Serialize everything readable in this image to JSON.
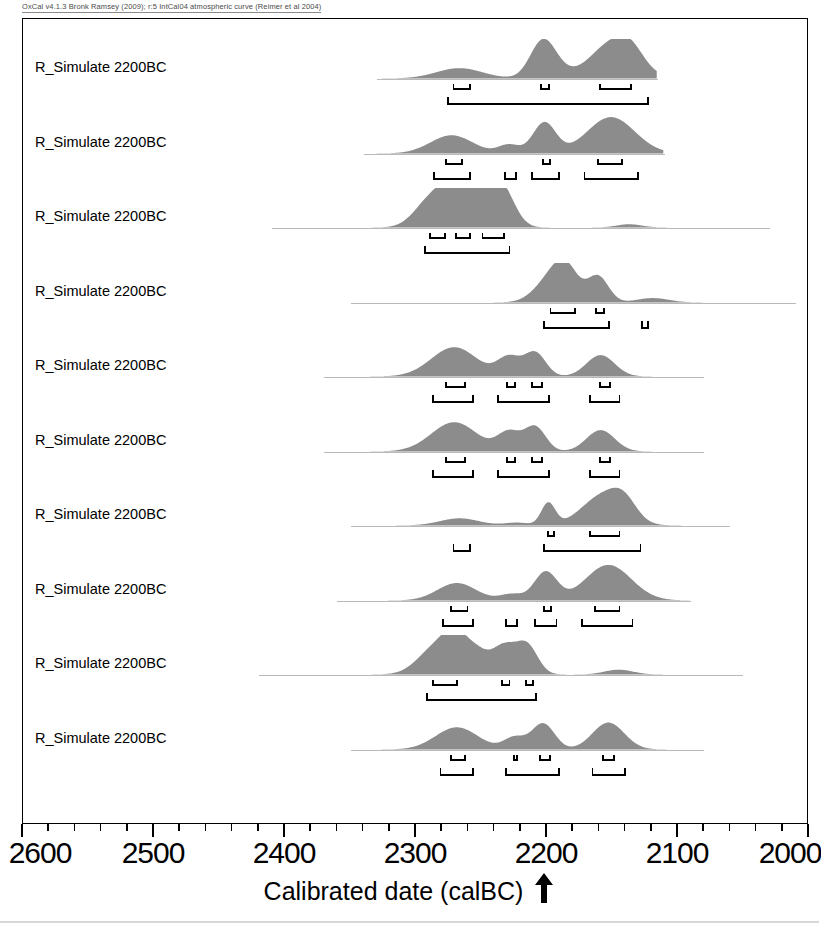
{
  "header": {
    "credit": "OxCal v4.1.3 Bronk Ramsey (2009); r:5 IntCal04 atmospheric curve (Reimer et al 2004)"
  },
  "axis": {
    "title": "Calibrated date (calBC)",
    "arrow_icon": "up-arrow-icon",
    "arrow_points_to": 2200,
    "tick_labels": [
      "2600",
      "2500",
      "2400",
      "2300",
      "2200",
      "2100",
      "2000"
    ],
    "major_ticks": [
      2600,
      2500,
      2400,
      2300,
      2200,
      2100,
      2000
    ],
    "minor_tick_step": 20,
    "min": 2000,
    "max": 2600,
    "direction": "reversed"
  },
  "style": {
    "fill_color": "#8c8c8c",
    "baseline_color": "#b9b9b9",
    "frame_color": "#000000",
    "bracket_color": "#000000"
  },
  "chart_data": {
    "type": "area",
    "xlabel": "Calibrated date (calBC)",
    "ylabel": "",
    "xlim": [
      2600,
      2000
    ],
    "grid": false,
    "legend": "none",
    "sigma_levels": [
      "68.2% (1 sigma)",
      "95.4% (2 sigma)"
    ],
    "rows": [
      {
        "label": "R_Simulate 2200BC",
        "baseline": [
          2330,
          2115
        ],
        "peaks": [
          {
            "center": 2266,
            "height": 0.26,
            "width": 26
          },
          {
            "center": 2203,
            "height": 0.74,
            "width": 14
          },
          {
            "center": 2196,
            "height": 0.3,
            "width": 16
          },
          {
            "center": 2148,
            "height": 0.92,
            "width": 26
          },
          {
            "center": 2135,
            "height": 0.3,
            "width": 14
          }
        ],
        "sigma1": [
          [
            2272,
            2258
          ],
          [
            2205,
            2198
          ],
          [
            2160,
            2135
          ]
        ],
        "sigma2": [
          [
            2276,
            2122
          ]
        ]
      },
      {
        "label": "R_Simulate 2200BC",
        "baseline": [
          2340,
          2110
        ],
        "peaks": [
          {
            "center": 2272,
            "height": 0.46,
            "width": 24
          },
          {
            "center": 2228,
            "height": 0.22,
            "width": 12
          },
          {
            "center": 2201,
            "height": 0.78,
            "width": 13
          },
          {
            "center": 2150,
            "height": 0.92,
            "width": 27
          }
        ],
        "sigma1": [
          [
            2278,
            2264
          ],
          [
            2204,
            2197
          ],
          [
            2162,
            2142
          ]
        ],
        "sigma2": [
          [
            2287,
            2258
          ],
          [
            2233,
            2223
          ],
          [
            2212,
            2190
          ],
          [
            2172,
            2130
          ]
        ]
      },
      {
        "label": "R_Simulate 2200BC",
        "baseline": [
          2410,
          2030
        ],
        "peaks": [
          {
            "center": 2288,
            "height": 0.7,
            "width": 18
          },
          {
            "center": 2272,
            "height": 0.78,
            "width": 14
          },
          {
            "center": 2256,
            "height": 0.6,
            "width": 14
          },
          {
            "center": 2243,
            "height": 0.74,
            "width": 16
          },
          {
            "center": 2232,
            "height": 0.66,
            "width": 14
          },
          {
            "center": 2136,
            "height": 0.08,
            "width": 14
          }
        ],
        "sigma1": [
          [
            2290,
            2277
          ],
          [
            2270,
            2258
          ],
          [
            2250,
            2232
          ]
        ],
        "sigma2": [
          [
            2294,
            2228
          ]
        ]
      },
      {
        "label": "R_Simulate 2200BC",
        "baseline": [
          2350,
          2010
        ],
        "peaks": [
          {
            "center": 2196,
            "height": 0.58,
            "width": 18
          },
          {
            "center": 2184,
            "height": 0.7,
            "width": 14
          },
          {
            "center": 2160,
            "height": 0.66,
            "width": 12
          },
          {
            "center": 2118,
            "height": 0.11,
            "width": 18
          }
        ],
        "sigma1": [
          [
            2198,
            2178
          ],
          [
            2163,
            2156
          ]
        ],
        "sigma2": [
          [
            2203,
            2152
          ],
          [
            2128,
            2122
          ]
        ]
      },
      {
        "label": "R_Simulate 2200BC",
        "baseline": [
          2370,
          2080
        ],
        "peaks": [
          {
            "center": 2270,
            "height": 0.74,
            "width": 26
          },
          {
            "center": 2228,
            "height": 0.48,
            "width": 13
          },
          {
            "center": 2208,
            "height": 0.6,
            "width": 12
          },
          {
            "center": 2158,
            "height": 0.54,
            "width": 16
          }
        ],
        "sigma1": [
          [
            2278,
            2262
          ],
          [
            2231,
            2224
          ],
          [
            2212,
            2203
          ],
          [
            2160,
            2151
          ]
        ],
        "sigma2": [
          [
            2288,
            2256
          ],
          [
            2238,
            2198
          ],
          [
            2168,
            2144
          ]
        ]
      },
      {
        "label": "R_Simulate 2200BC",
        "baseline": [
          2370,
          2080
        ],
        "peaks": [
          {
            "center": 2270,
            "height": 0.74,
            "width": 26
          },
          {
            "center": 2228,
            "height": 0.48,
            "width": 13
          },
          {
            "center": 2208,
            "height": 0.62,
            "width": 12
          },
          {
            "center": 2158,
            "height": 0.54,
            "width": 16
          }
        ],
        "sigma1": [
          [
            2278,
            2262
          ],
          [
            2231,
            2224
          ],
          [
            2212,
            2203
          ],
          [
            2160,
            2151
          ]
        ],
        "sigma2": [
          [
            2288,
            2256
          ],
          [
            2238,
            2198
          ],
          [
            2168,
            2144
          ]
        ]
      },
      {
        "label": "R_Simulate 2200BC",
        "baseline": [
          2350,
          2060
        ],
        "peaks": [
          {
            "center": 2266,
            "height": 0.18,
            "width": 22
          },
          {
            "center": 2222,
            "height": 0.07,
            "width": 14
          },
          {
            "center": 2198,
            "height": 0.56,
            "width": 8
          },
          {
            "center": 2156,
            "height": 0.76,
            "width": 24
          },
          {
            "center": 2140,
            "height": 0.4,
            "width": 14
          }
        ],
        "sigma1": [
          [
            2200,
            2194
          ],
          [
            2168,
            2144
          ]
        ],
        "sigma2": [
          [
            2272,
            2258
          ],
          [
            2203,
            2128
          ]
        ]
      },
      {
        "label": "R_Simulate 2200BC",
        "baseline": [
          2360,
          2090
        ],
        "peaks": [
          {
            "center": 2268,
            "height": 0.44,
            "width": 22
          },
          {
            "center": 2226,
            "height": 0.16,
            "width": 13
          },
          {
            "center": 2200,
            "height": 0.72,
            "width": 13
          },
          {
            "center": 2152,
            "height": 0.9,
            "width": 26
          }
        ],
        "sigma1": [
          [
            2274,
            2260
          ],
          [
            2203,
            2196
          ],
          [
            2164,
            2144
          ]
        ],
        "sigma2": [
          [
            2280,
            2256
          ],
          [
            2232,
            2222
          ],
          [
            2210,
            2192
          ],
          [
            2174,
            2134
          ]
        ]
      },
      {
        "label": "R_Simulate 2200BC",
        "baseline": [
          2420,
          2050
        ],
        "peaks": [
          {
            "center": 2284,
            "height": 0.68,
            "width": 20
          },
          {
            "center": 2268,
            "height": 0.78,
            "width": 14
          },
          {
            "center": 2252,
            "height": 0.44,
            "width": 12
          },
          {
            "center": 2232,
            "height": 0.72,
            "width": 14
          },
          {
            "center": 2214,
            "height": 0.7,
            "width": 12
          },
          {
            "center": 2144,
            "height": 0.12,
            "width": 16
          }
        ],
        "sigma1": [
          [
            2288,
            2268
          ],
          [
            2235,
            2228
          ],
          [
            2217,
            2210
          ]
        ],
        "sigma2": [
          [
            2292,
            2208
          ]
        ]
      },
      {
        "label": "R_Simulate 2200BC",
        "baseline": [
          2350,
          2080
        ],
        "peaks": [
          {
            "center": 2268,
            "height": 0.56,
            "width": 24
          },
          {
            "center": 2224,
            "height": 0.3,
            "width": 12
          },
          {
            "center": 2202,
            "height": 0.66,
            "width": 13
          },
          {
            "center": 2152,
            "height": 0.68,
            "width": 18
          }
        ],
        "sigma1": [
          [
            2274,
            2262
          ],
          [
            2226,
            2222
          ],
          [
            2206,
            2197
          ],
          [
            2158,
            2148
          ]
        ],
        "sigma2": [
          [
            2282,
            2256
          ],
          [
            2232,
            2190
          ],
          [
            2166,
            2140
          ]
        ]
      }
    ]
  }
}
